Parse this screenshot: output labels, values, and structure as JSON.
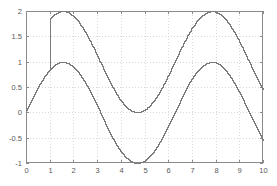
{
  "figure": {
    "background_color": "#ffffff",
    "frame_color": "#8a8a8a",
    "grid_color": "#c8c8c8",
    "plot_area": {
      "left": 26,
      "top": 11,
      "right": 263,
      "bottom": 163
    }
  },
  "chart_data": {
    "type": "line",
    "title": "",
    "xlabel": "",
    "ylabel": "",
    "xlim": [
      0,
      10
    ],
    "ylim": [
      -1,
      2
    ],
    "grid": true,
    "grid_style": "dotted",
    "legend": null,
    "legend_position": "none",
    "xticks": [
      0,
      1,
      2,
      3,
      4,
      5,
      6,
      7,
      8,
      9,
      10
    ],
    "xticklabels": [
      "0",
      "1",
      "2",
      "3",
      "4",
      "5",
      "6",
      "7",
      "8",
      "9",
      "10"
    ],
    "yticks": [
      -1,
      -0.5,
      0,
      0.5,
      1,
      1.5,
      2
    ],
    "yticklabels": [
      "-1",
      "-0.5",
      "0",
      "0.5",
      "1",
      "1.5",
      "2"
    ],
    "series": [
      {
        "name": "sin(x) + 1",
        "color": "#7a7a7a",
        "formula": "sin(x)+1",
        "x_start": 1.0,
        "x_end": 10.0,
        "leading_vertical_jump": {
          "x": 1.0,
          "from": 0.841,
          "to": 1.841
        },
        "x": [
          1.0,
          1.2,
          1.4,
          1.6,
          1.8,
          2.0,
          2.2,
          2.4,
          2.6,
          2.8,
          3.0,
          3.2,
          3.4,
          3.6,
          3.8,
          4.0,
          4.2,
          4.4,
          4.6,
          4.8,
          5.0,
          5.2,
          5.4,
          5.6,
          5.8,
          6.0,
          6.2,
          6.4,
          6.6,
          6.8,
          7.0,
          7.2,
          7.4,
          7.6,
          7.8,
          8.0,
          8.2,
          8.4,
          8.6,
          8.8,
          9.0,
          9.2,
          9.4,
          9.6,
          9.8,
          10.0
        ],
        "values": [
          1.841,
          1.932,
          1.985,
          2.0,
          1.974,
          1.909,
          1.808,
          1.675,
          1.516,
          1.335,
          1.141,
          0.942,
          0.744,
          0.558,
          0.388,
          0.243,
          0.129,
          0.049,
          0.006,
          0.004,
          0.041,
          0.117,
          0.228,
          0.369,
          0.536,
          0.721,
          0.917,
          1.116,
          1.311,
          1.495,
          1.657,
          1.793,
          1.895,
          1.961,
          1.999,
          1.989,
          1.941,
          1.855,
          1.734,
          1.585,
          1.412,
          1.222,
          1.024,
          0.826,
          0.634,
          0.456
        ]
      },
      {
        "name": "sin(x)",
        "color": "#7a7a7a",
        "formula": "sin(x)",
        "x_start": 0.0,
        "x_end": 10.0,
        "x": [
          0.0,
          0.2,
          0.4,
          0.6,
          0.8,
          1.0,
          1.2,
          1.4,
          1.6,
          1.8,
          2.0,
          2.2,
          2.4,
          2.6,
          2.8,
          3.0,
          3.2,
          3.4,
          3.6,
          3.8,
          4.0,
          4.2,
          4.4,
          4.6,
          4.8,
          5.0,
          5.2,
          5.4,
          5.6,
          5.8,
          6.0,
          6.2,
          6.4,
          6.6,
          6.8,
          7.0,
          7.2,
          7.4,
          7.6,
          7.8,
          8.0,
          8.2,
          8.4,
          8.6,
          8.8,
          9.0,
          9.2,
          9.4,
          9.6,
          9.8,
          10.0
        ],
        "values": [
          0.0,
          0.199,
          0.389,
          0.565,
          0.717,
          0.841,
          0.932,
          0.985,
          1.0,
          0.974,
          0.909,
          0.808,
          0.675,
          0.516,
          0.335,
          0.141,
          -0.058,
          -0.256,
          -0.443,
          -0.612,
          -0.757,
          -0.872,
          -0.951,
          -0.994,
          -0.996,
          -0.959,
          -0.883,
          -0.773,
          -0.631,
          -0.465,
          -0.279,
          -0.083,
          0.116,
          0.311,
          0.495,
          0.657,
          0.793,
          0.895,
          0.961,
          0.999,
          0.989,
          0.941,
          0.855,
          0.734,
          0.585,
          0.412,
          0.222,
          0.024,
          -0.174,
          -0.366,
          -0.544
        ]
      }
    ]
  }
}
